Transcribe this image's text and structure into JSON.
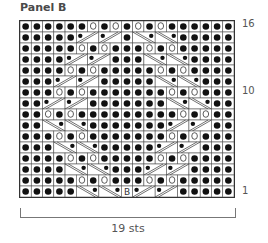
{
  "title": "Panel B",
  "row_labels": [
    {
      "label": "16",
      "row": 16
    },
    {
      "label": "10",
      "row": 10
    },
    {
      "label": "1",
      "row": 1
    }
  ],
  "width_label": "19 sts",
  "stitches": 19,
  "rows": 16,
  "legend_symbols": {
    "dot": "purl",
    "O": "yarn-over",
    "L": "cable-left-slant (/ with dot)",
    "R": "cable-right-slant (\\ with dot)",
    "B": "bobble"
  },
  "chart": [
    "ddddddOdOdOdOdddddd",
    "dddddLLLLdRRRRddddd",
    "dddddOdOdddOdOddddd",
    "ddddLLLLdddRRRRdddd",
    "ddddOdOdddddOdOdddd",
    "dddLLLLdddddRRRRddd",
    "dddOdOdddddddOdOddd",
    "ddLLLLdddddddRRRRdd",
    "ddOdOdddddddddOdOdd",
    "ddRRRRdddddddLLLLdd",
    "dddOdOdddddddOdOddd",
    "dddRRRRdddddLLLLddd",
    "ddddOdOdddddOdOdddd",
    "ddddRRRRdddLLLLdddd",
    "dddddOdOdddOdOddddd",
    "dddddRRRRBLLLLddddd"
  ]
}
